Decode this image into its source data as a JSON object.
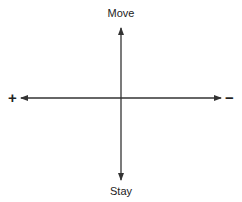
{
  "diagram": {
    "top_label": "Move",
    "bottom_label": "Stay",
    "left_sign": "+",
    "right_sign": "−",
    "line_color": "#333333"
  }
}
